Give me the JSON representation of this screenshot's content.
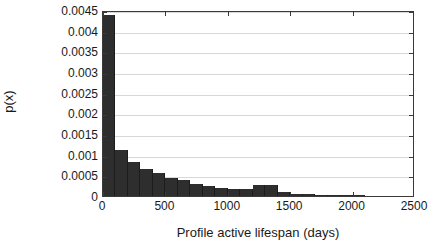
{
  "chart_data": {
    "type": "bar",
    "title": "",
    "xlabel": "Profile active lifespan (days)",
    "ylabel": "p(x)",
    "xlim": [
      0,
      2500
    ],
    "ylim": [
      0,
      0.0045
    ],
    "grid": true,
    "legend": null,
    "bin_width": 100,
    "xtick_labels": [
      "0",
      "500",
      "1000",
      "1500",
      "2000",
      "2500"
    ],
    "xtick_values": [
      0,
      500,
      1000,
      1500,
      2000,
      2500
    ],
    "ytick_labels": [
      "0",
      "0.0005",
      "0.001",
      "0.0015",
      "0.002",
      "0.0025",
      "0.003",
      "0.0035",
      "0.004",
      "0.0045"
    ],
    "ytick_values": [
      0,
      0.0005,
      0.001,
      0.0015,
      0.002,
      0.0025,
      0.003,
      0.0035,
      0.004,
      0.0045
    ],
    "bins": [
      {
        "x0": 0,
        "x1": 100,
        "value": 0.00438
      },
      {
        "x0": 100,
        "x1": 200,
        "value": 0.00112
      },
      {
        "x0": 200,
        "x1": 300,
        "value": 0.00083
      },
      {
        "x0": 300,
        "x1": 400,
        "value": 0.00066
      },
      {
        "x0": 400,
        "x1": 500,
        "value": 0.00055
      },
      {
        "x0": 500,
        "x1": 600,
        "value": 0.00044
      },
      {
        "x0": 600,
        "x1": 700,
        "value": 0.00038
      },
      {
        "x0": 700,
        "x1": 800,
        "value": 0.0003
      },
      {
        "x0": 800,
        "x1": 900,
        "value": 0.00025
      },
      {
        "x0": 900,
        "x1": 1000,
        "value": 0.0002
      },
      {
        "x0": 1000,
        "x1": 1100,
        "value": 0.00017
      },
      {
        "x0": 1100,
        "x1": 1200,
        "value": 0.00017
      },
      {
        "x0": 1200,
        "x1": 1300,
        "value": 0.00026
      },
      {
        "x0": 1300,
        "x1": 1400,
        "value": 0.00026
      },
      {
        "x0": 1400,
        "x1": 1500,
        "value": 0.0001
      },
      {
        "x0": 1500,
        "x1": 1600,
        "value": 5e-05
      },
      {
        "x0": 1600,
        "x1": 1700,
        "value": 4e-05
      },
      {
        "x0": 1700,
        "x1": 1800,
        "value": 3e-05
      },
      {
        "x0": 1800,
        "x1": 1900,
        "value": 2.5e-05
      },
      {
        "x0": 1900,
        "x1": 2000,
        "value": 2e-05
      },
      {
        "x0": 2000,
        "x1": 2100,
        "value": 1.5e-05
      },
      {
        "x0": 2100,
        "x1": 2200,
        "value": 1e-05
      },
      {
        "x0": 2200,
        "x1": 2300,
        "value": 1e-05
      },
      {
        "x0": 2300,
        "x1": 2400,
        "value": 8e-06
      },
      {
        "x0": 2400,
        "x1": 2500,
        "value": 5e-06
      }
    ],
    "colors": {
      "bar": "#2e2e2e",
      "grid": "#d8d8d8",
      "axis": "#3a3a3a",
      "text": "#1a1a1a",
      "background": "#ffffff"
    }
  }
}
